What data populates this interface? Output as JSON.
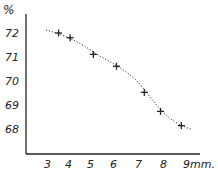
{
  "chart_data": {
    "type": "scatter",
    "title": "",
    "xlabel": "mm.",
    "ylabel": "%",
    "x_ticks": [
      "3",
      "4",
      "5",
      "6",
      "7",
      "8",
      "9mm."
    ],
    "y_ticks": [
      "72",
      "71",
      "70",
      "69",
      "68"
    ],
    "xlim": [
      2,
      9.5
    ],
    "ylim": [
      66.9,
      72.6
    ],
    "grid": false,
    "legend": null,
    "series": [
      {
        "name": "measurements",
        "marker": "+",
        "trend_line": "dotted",
        "x": [
          3.5,
          4.0,
          5.0,
          6.0,
          7.2,
          7.9,
          8.8
        ],
        "y": [
          72.0,
          71.8,
          71.1,
          70.6,
          69.5,
          68.7,
          68.1
        ]
      }
    ]
  },
  "axes": {
    "y_unit_label": "%",
    "y_labels": [
      "72",
      "71",
      "70",
      "69",
      "68"
    ],
    "x_labels": [
      "3",
      "4",
      "5",
      "6",
      "7",
      "8",
      "9mm."
    ]
  },
  "colors": {
    "ink": "#222222",
    "background": "#ffffff"
  }
}
